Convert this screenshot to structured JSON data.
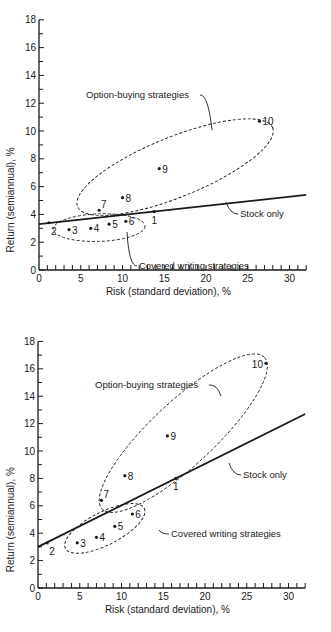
{
  "chart_data": [
    {
      "type": "scatter",
      "title": "",
      "xlabel": "Risk (standard deviation), %",
      "ylabel": "Return (semiannual), %",
      "xlim": [
        0,
        32
      ],
      "ylim": [
        0,
        18
      ],
      "xticks": [
        0,
        5,
        10,
        15,
        20,
        25,
        30
      ],
      "yticks": [
        0,
        2,
        4,
        6,
        8,
        10,
        12,
        14,
        16,
        18
      ],
      "grid": false,
      "points": [
        {
          "label": "1",
          "x": 13.8,
          "y": 4.2
        },
        {
          "label": "2",
          "x": 1.2,
          "y": 3.4
        },
        {
          "label": "3",
          "x": 3.6,
          "y": 2.9
        },
        {
          "label": "4",
          "x": 6.2,
          "y": 3.0
        },
        {
          "label": "5",
          "x": 8.4,
          "y": 3.3
        },
        {
          "label": "6",
          "x": 10.4,
          "y": 3.5
        },
        {
          "label": "7",
          "x": 7.2,
          "y": 4.3
        },
        {
          "label": "8",
          "x": 10.0,
          "y": 5.2
        },
        {
          "label": "9",
          "x": 14.4,
          "y": 7.3
        },
        {
          "label": "10",
          "x": 26.4,
          "y": 10.7
        }
      ],
      "series": [
        {
          "name": "Stock only",
          "type": "line",
          "x": [
            0,
            32
          ],
          "y": [
            3.3,
            5.4
          ]
        }
      ],
      "annotations": [
        {
          "text": "Option-buying strategies",
          "group": [
            "7",
            "8",
            "9",
            "10"
          ]
        },
        {
          "text": "Covered writing strategies",
          "group": [
            "3",
            "4",
            "5",
            "6"
          ]
        },
        {
          "text": "Stock only",
          "target": "line"
        }
      ]
    },
    {
      "type": "scatter",
      "title": "",
      "xlabel": "Risk (standard deviation), %",
      "ylabel": "Return (semiannual), %",
      "xlim": [
        0,
        32
      ],
      "ylim": [
        0,
        18
      ],
      "xticks": [
        0,
        5,
        10,
        15,
        20,
        25,
        30
      ],
      "yticks": [
        0,
        2,
        4,
        6,
        8,
        10,
        12,
        14,
        16,
        18
      ],
      "grid": false,
      "points": [
        {
          "label": "1",
          "x": 16.5,
          "y": 8.0
        },
        {
          "label": "2",
          "x": 1.1,
          "y": 3.3
        },
        {
          "label": "3",
          "x": 4.7,
          "y": 3.3
        },
        {
          "label": "4",
          "x": 7.0,
          "y": 3.7
        },
        {
          "label": "5",
          "x": 9.2,
          "y": 4.5
        },
        {
          "label": "6",
          "x": 11.3,
          "y": 5.4
        },
        {
          "label": "7",
          "x": 7.6,
          "y": 6.4
        },
        {
          "label": "8",
          "x": 10.4,
          "y": 8.2
        },
        {
          "label": "9",
          "x": 15.5,
          "y": 11.1
        },
        {
          "label": "10",
          "x": 27.3,
          "y": 16.4
        }
      ],
      "series": [
        {
          "name": "Stock only",
          "type": "line",
          "x": [
            0,
            32
          ],
          "y": [
            3.0,
            12.7
          ]
        }
      ],
      "annotations": [
        {
          "text": "Option-buying strategies",
          "group": [
            "7",
            "8",
            "9",
            "10"
          ]
        },
        {
          "text": "Covered writing strategies",
          "group": [
            "3",
            "4",
            "5",
            "6"
          ]
        },
        {
          "text": "Stock only",
          "target": "line"
        }
      ]
    }
  ],
  "charts": [
    {
      "xlabel": "Risk (standard deviation), %",
      "ylabel": "Return (semiannual), %",
      "option_label": "Option-buying strategies",
      "covered_label": "Covered writing strategies",
      "stock_label": "Stock only"
    },
    {
      "xlabel": "Risk (standard deviation), %",
      "ylabel": "Return (semiannual), %",
      "option_label": "Option-buying strategies",
      "covered_label": "Covered writing strategies",
      "stock_label": "Stock only"
    }
  ]
}
